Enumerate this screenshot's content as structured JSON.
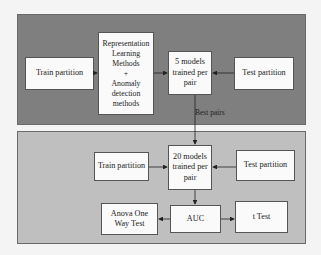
{
  "diagram": {
    "top_panel": {
      "color": "#7f7f7f",
      "nodes": {
        "train": "Train partition",
        "methods": "Representation\nLearning\nMethods\n+\nAnomaly\ndetection\nmethods",
        "models": "5 models\ntrained per\npair",
        "test": "Test partition"
      }
    },
    "edge_label": "Best pairs",
    "bottom_panel": {
      "color": "#bfbfbf",
      "nodes": {
        "train": "Train partition",
        "models": "20 models\ntrained per\npair",
        "test": "Test partition",
        "auc": "AUC",
        "anova": "Anova One\nWay Test",
        "ttest": "t Test"
      }
    },
    "edges": [
      [
        "Train partition",
        "Representation Learning Methods + Anomaly detection methods"
      ],
      [
        "Representation Learning Methods + Anomaly detection methods",
        "5 models trained per pair"
      ],
      [
        "Test partition",
        "5 models trained per pair"
      ],
      [
        "5 models trained per pair",
        "20 models trained per pair",
        "Best pairs"
      ],
      [
        "Train partition",
        "20 models trained per pair"
      ],
      [
        "Test partition",
        "20 models trained per pair"
      ],
      [
        "20 models trained per pair",
        "AUC"
      ],
      [
        "AUC",
        "Anova One Way Test"
      ],
      [
        "AUC",
        "t Test"
      ]
    ]
  }
}
